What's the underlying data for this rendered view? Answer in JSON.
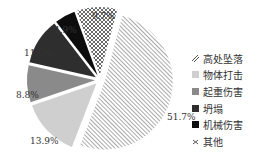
{
  "chart_data": {
    "type": "pie",
    "title": "",
    "categories": [
      "高处坠落",
      "物体打击",
      "起重伤害",
      "坍塌",
      "机械伤害",
      "其他"
    ],
    "values": [
      51.7,
      13.9,
      8.8,
      11.0,
      4.9,
      9.7
    ],
    "labels": [
      "51.7%",
      "13.9%",
      "8.8%",
      "11.0%",
      "4.9%",
      "9.7%"
    ],
    "patterns": [
      "diagonal-hatch",
      "light-gray",
      "mid-gray",
      "dark-gray",
      "black",
      "cross-hatch"
    ],
    "colors": [
      "#ffffff",
      "#cfcfcf",
      "#8a8a8a",
      "#2e2e2e",
      "#0d0d0d",
      "#ffffff"
    ],
    "legend_position": "right",
    "exploded": true
  },
  "legend": {
    "items": [
      {
        "label": "高处坠落"
      },
      {
        "label": "物体打击"
      },
      {
        "label": "起重伤害"
      },
      {
        "label": "坍塌"
      },
      {
        "label": "机械伤害"
      },
      {
        "label": "其他"
      }
    ]
  },
  "pct_labels": {
    "p0": "51.7%",
    "p1": "13.9%",
    "p2": "8.8%",
    "p3": "11.0%",
    "p4": "4.9%",
    "p5": "9.7%"
  }
}
